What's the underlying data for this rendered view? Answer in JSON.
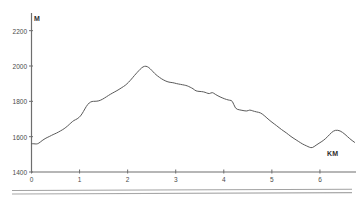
{
  "chart_data": {
    "type": "line",
    "title": "",
    "subtitle": "",
    "xlabel": "KM",
    "ylabel": "M",
    "xlim": [
      0,
      6.75
    ],
    "ylim": [
      1400,
      2300
    ],
    "grid": false,
    "legend": null,
    "y_ticks": [
      1400,
      1600,
      1800,
      2000,
      2200
    ],
    "x_ticks": [
      0,
      1,
      2,
      3,
      4,
      5,
      6
    ],
    "y_tick_labels": [
      "1400",
      "1600",
      "1800",
      "2000",
      "2200"
    ],
    "x_tick_labels": [
      "0",
      "1",
      "2",
      "3",
      "4",
      "5",
      "6"
    ],
    "series": [
      {
        "name": "elevation",
        "color": "#595959",
        "x": [
          0.0,
          0.05,
          0.1,
          0.15,
          0.22,
          0.3,
          0.38,
          0.45,
          0.52,
          0.6,
          0.68,
          0.75,
          0.82,
          0.88,
          0.95,
          1.02,
          1.08,
          1.14,
          1.2,
          1.26,
          1.32,
          1.4,
          1.48,
          1.56,
          1.64,
          1.72,
          1.8,
          1.88,
          1.95,
          2.02,
          2.08,
          2.14,
          2.2,
          2.26,
          2.32,
          2.38,
          2.44,
          2.5,
          2.56,
          2.62,
          2.7,
          2.78,
          2.86,
          2.94,
          3.02,
          3.1,
          3.18,
          3.24,
          3.3,
          3.36,
          3.42,
          3.5,
          3.58,
          3.64,
          3.7,
          3.76,
          3.82,
          3.9,
          3.98,
          4.06,
          4.12,
          4.18,
          4.24,
          4.32,
          4.4,
          4.48,
          4.54,
          4.6,
          4.68,
          4.76,
          4.84,
          4.92,
          5.0,
          5.1,
          5.2,
          5.3,
          5.4,
          5.48,
          5.56,
          5.64,
          5.72,
          5.78,
          5.84,
          5.92,
          6.0,
          6.08,
          6.16,
          6.24,
          6.32,
          6.42,
          6.52,
          6.62,
          6.72
        ],
        "y": [
          1560,
          1560,
          1558,
          1562,
          1578,
          1592,
          1602,
          1612,
          1620,
          1632,
          1645,
          1660,
          1678,
          1692,
          1700,
          1716,
          1742,
          1772,
          1792,
          1800,
          1800,
          1802,
          1812,
          1826,
          1840,
          1852,
          1864,
          1878,
          1890,
          1908,
          1926,
          1946,
          1964,
          1982,
          1996,
          2000,
          1992,
          1976,
          1958,
          1944,
          1928,
          1916,
          1908,
          1906,
          1900,
          1896,
          1892,
          1888,
          1880,
          1872,
          1858,
          1856,
          1854,
          1848,
          1842,
          1852,
          1840,
          1828,
          1818,
          1810,
          1806,
          1804,
          1758,
          1752,
          1748,
          1744,
          1752,
          1746,
          1740,
          1736,
          1720,
          1700,
          1682,
          1662,
          1640,
          1622,
          1600,
          1586,
          1572,
          1558,
          1548,
          1540,
          1536,
          1552,
          1566,
          1580,
          1600,
          1624,
          1638,
          1634,
          1614,
          1588,
          1568
        ]
      }
    ],
    "annotations": [],
    "route_bars": 2
  },
  "axes": {
    "y_axis_title": "M",
    "x_axis_title": "KM"
  },
  "colors": {
    "line": "#595959",
    "axis": "#6e6e6e",
    "text": "#3a3a3a",
    "route_bar": "#9a9a9a",
    "background": "#ffffff"
  }
}
